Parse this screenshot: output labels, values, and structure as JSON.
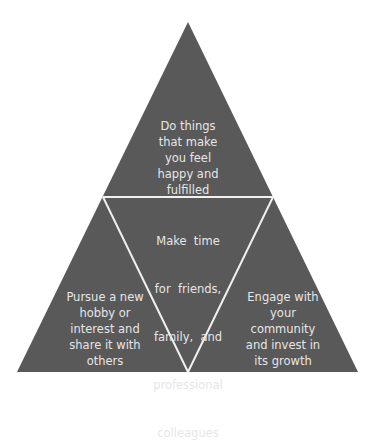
{
  "diagram": {
    "type": "triangle-quadrant",
    "fill_color": "#5a5a5a",
    "line_color": "#f2f2f2",
    "text_color": "#e8e8e8",
    "sections": {
      "top": {
        "lines": [
          "Do things",
          "that make",
          "you feel",
          "happy and",
          "fulfilled"
        ]
      },
      "center": {
        "lines": [
          "Make  time",
          "for  friends,",
          "family,  and",
          "professional",
          "colleagues"
        ]
      },
      "bottom_left": {
        "lines": [
          "Pursue a new",
          "hobby or",
          "interest and",
          "share it with",
          "others"
        ]
      },
      "bottom_right": {
        "lines": [
          "Engage with",
          "your",
          "community",
          "and invest in",
          "its growth"
        ]
      }
    }
  }
}
